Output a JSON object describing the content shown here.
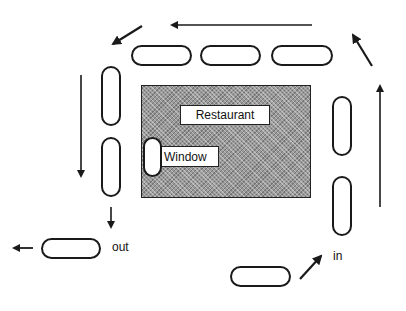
{
  "diagram": {
    "title": "",
    "building": {
      "label": "Restaurant"
    },
    "window": {
      "label": "Window"
    },
    "labels": {
      "exit": "out",
      "entry": "in"
    },
    "colors": {
      "line": "#1a1a1a",
      "building_fill": "#9a9a9a",
      "background": "#ffffff"
    },
    "cars": [
      {
        "id": "entry-car",
        "orientation": "horizontal"
      },
      {
        "id": "right-lane-car-lower",
        "orientation": "vertical"
      },
      {
        "id": "right-lane-car-upper",
        "orientation": "vertical"
      },
      {
        "id": "top-lane-car-right",
        "orientation": "horizontal"
      },
      {
        "id": "top-lane-car-middle",
        "orientation": "horizontal"
      },
      {
        "id": "top-lane-car-left",
        "orientation": "horizontal"
      },
      {
        "id": "left-lane-car-upper",
        "orientation": "vertical"
      },
      {
        "id": "left-lane-car-lower",
        "orientation": "vertical"
      },
      {
        "id": "window-car",
        "orientation": "vertical"
      },
      {
        "id": "exit-car",
        "orientation": "horizontal"
      }
    ],
    "arrows": [
      {
        "id": "entry-arrow",
        "direction": "up-right"
      },
      {
        "id": "right-lane-arrow",
        "direction": "up"
      },
      {
        "id": "top-right-corner-arrow",
        "direction": "up-left"
      },
      {
        "id": "top-lane-arrow",
        "direction": "left"
      },
      {
        "id": "top-left-corner-arrow",
        "direction": "down-left"
      },
      {
        "id": "left-lane-arrow",
        "direction": "down"
      },
      {
        "id": "exit-down-arrow",
        "direction": "down"
      },
      {
        "id": "exit-left-arrow",
        "direction": "left"
      }
    ]
  }
}
